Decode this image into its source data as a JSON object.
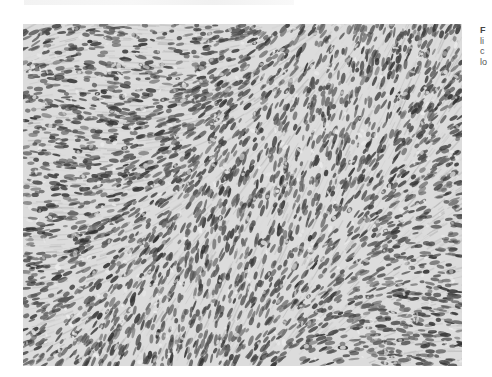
{
  "figure": {
    "image_description": "Grayscale photomicrograph of densely cellular spindle cell proliferation in fascicular/storiform pattern",
    "background_color": "#c9c9c9",
    "nucleus_color": "#3e3e3e",
    "stroma_color": "#dcdcdc"
  },
  "caption": {
    "label": "F",
    "lines": [
      "li",
      "c",
      "lo"
    ]
  },
  "top_fragment": {
    "text": ""
  }
}
